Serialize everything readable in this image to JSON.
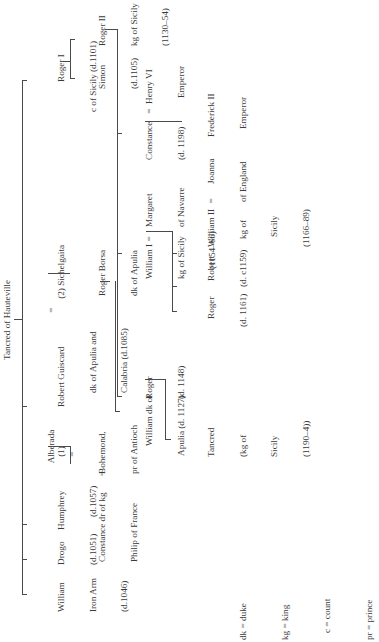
{
  "title": "Tancred of Hauteville",
  "generation1": {
    "william": {
      "name": "William",
      "line2": "Iron Arm",
      "line3": "(d.1046)"
    },
    "drogo": {
      "name": "Drogo",
      "line2": "(d.1051)"
    },
    "humphrey": {
      "name": "Humphrey",
      "line2": "(d.1057)"
    },
    "alberada": {
      "name": "Alberada",
      "marriage": "(1)",
      "eq": "="
    },
    "robert_guiscard": {
      "name": "Robert Guiscard",
      "line2": "dk of Apulia and",
      "line3": "Calabria (d.1085)"
    },
    "sichelgaita": {
      "eq": "=",
      "name": "(2) Sichelgaita"
    },
    "roger_i": {
      "name": "Roger I",
      "line2": "c of Sicily (d.1101)"
    }
  },
  "generation2": {
    "constance_france": {
      "name": "Constance dr of kg",
      "line2": "Philip of France",
      "eq": "="
    },
    "bohemond": {
      "name": "Bohemond,",
      "line2": "pr of Antioch"
    },
    "roger_borsa": {
      "name": "Roger Borsa",
      "line2": "dk of Apulia"
    },
    "simon": {
      "name": "Simon",
      "line2": "(d.1105)"
    },
    "roger_ii": {
      "name": "Roger II",
      "line2": "kg of Sicily",
      "line3": "(1130–54)"
    }
  },
  "generation3": {
    "william_apulia": {
      "name": "William dk of",
      "line2": "Apulia (d. 1127)"
    },
    "roger_1148": {
      "name": "Roger",
      "line2": "(d. 1148)"
    },
    "william_i": {
      "name": "William I",
      "line2": "kg of Sicily",
      "line3": "(1154–66)",
      "eq": "="
    },
    "margaret": {
      "name": "Margaret",
      "line2": "of Navarre"
    },
    "constance_1198": {
      "name": "Constance",
      "line2": "(d. 1198)",
      "eq": "="
    },
    "henry_vi": {
      "name": "Henry VI",
      "line2": "Emperor"
    }
  },
  "generation4": {
    "tancred": {
      "name": "Tancred",
      "line2": "(kg of",
      "line3": "Sicily",
      "line4": "(1190–4))"
    },
    "roger_1161": {
      "name": "Roger",
      "line2": "(d. 1161)"
    },
    "robert": {
      "name": "Robert",
      "line2": "(d. c1159)"
    },
    "william_ii": {
      "name": "William II",
      "line2": "kg of",
      "line3": "Sicily",
      "line4": "(1166–89)",
      "eq": "="
    },
    "joanna": {
      "name": "Joanna",
      "line2": "of England"
    },
    "frederick_ii": {
      "name": "Frederick II",
      "line2": "Emperor"
    }
  },
  "legend": [
    {
      "abbr": "dk = duke"
    },
    {
      "abbr": "kg = king"
    },
    {
      "abbr": "c = count"
    },
    {
      "abbr": "pr = prince"
    }
  ],
  "colors": {
    "line": "#4a4a4a",
    "text": "#3a3a3a",
    "background": "#ffffff"
  }
}
